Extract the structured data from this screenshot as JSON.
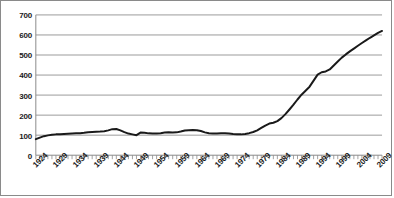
{
  "chart_data": {
    "type": "line",
    "title": "",
    "subtitle": "",
    "xlabel": "",
    "ylabel": "",
    "xlim": [
      1924,
      2010
    ],
    "ylim": [
      0,
      700
    ],
    "ytick_step": 100,
    "yticks": [
      0,
      100,
      200,
      300,
      400,
      500,
      600,
      700
    ],
    "xticks_labeled": [
      1924,
      1929,
      1934,
      1939,
      1944,
      1949,
      1954,
      1959,
      1964,
      1969,
      1974,
      1979,
      1984,
      1989,
      1994,
      1999,
      2004,
      2009
    ],
    "xtick_label_rotation_deg": -45,
    "xtick_minor_interval_years": 1,
    "grid": "horizontal",
    "legend": "none",
    "series": [
      {
        "name": "series-1",
        "color": "#1a1a1a",
        "line_width_px": 2,
        "x": [
          1924,
          1925,
          1926,
          1927,
          1928,
          1929,
          1930,
          1931,
          1932,
          1933,
          1934,
          1935,
          1936,
          1937,
          1938,
          1939,
          1940,
          1941,
          1942,
          1943,
          1944,
          1945,
          1946,
          1947,
          1948,
          1949,
          1950,
          1951,
          1952,
          1953,
          1954,
          1955,
          1956,
          1957,
          1958,
          1959,
          1960,
          1961,
          1962,
          1963,
          1964,
          1965,
          1966,
          1967,
          1968,
          1969,
          1970,
          1971,
          1972,
          1973,
          1974,
          1975,
          1976,
          1977,
          1978,
          1979,
          1980,
          1981,
          1982,
          1983,
          1984,
          1985,
          1986,
          1987,
          1988,
          1989,
          1990,
          1991,
          1992,
          1993,
          1994,
          1995,
          1996,
          1997,
          1998,
          1999,
          2000,
          2001,
          2002,
          2003,
          2004,
          2005,
          2006,
          2007,
          2008,
          2009,
          2010
        ],
        "values": [
          80,
          88,
          95,
          99,
          102,
          104,
          105,
          106,
          107,
          108,
          109,
          110,
          112,
          115,
          116,
          117,
          118,
          120,
          124,
          130,
          131,
          124,
          115,
          108,
          104,
          100,
          113,
          112,
          109,
          108,
          108,
          110,
          113,
          114,
          113,
          114,
          118,
          123,
          125,
          126,
          125,
          121,
          114,
          110,
          108,
          108,
          109,
          109,
          108,
          106,
          105,
          104,
          106,
          110,
          116,
          124,
          136,
          148,
          158,
          162,
          170,
          185,
          205,
          228,
          252,
          278,
          302,
          322,
          342,
          372,
          402,
          414,
          418,
          428,
          448,
          468,
          487,
          503,
          518,
          532,
          546,
          560,
          573,
          586,
          598,
          610,
          620
        ]
      }
    ]
  }
}
